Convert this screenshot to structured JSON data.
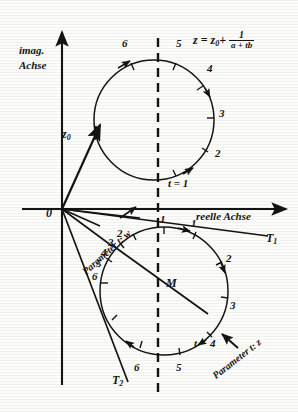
{
  "figure": {
    "kind": "complex-plane-diagram",
    "background": "#fdfdfc",
    "ink": "#141414"
  },
  "axes": {
    "imaginary_label_line1": "imag.",
    "imaginary_label_line2": "Achse",
    "real_label": "reelle Achse",
    "origin_label": "0"
  },
  "formula": {
    "lhs": "z",
    "equals": "=",
    "z0": "z",
    "z0_sub": "0",
    "plus": "+",
    "numerator": "1",
    "denominator": "a + tb"
  },
  "vectors": {
    "z0_label": "z",
    "z0_sub": "0"
  },
  "tangents": {
    "t1_label": "T",
    "t1_sub": "1",
    "t2_label": "T",
    "t2_sub": "2"
  },
  "center": {
    "label": "M"
  },
  "annotations": {
    "parameter_w": "Parameter t: w",
    "parameter_z": "Parameter t: z",
    "t_equals_one": "t = 1",
    "t_marker": "t"
  },
  "upper_circle": {
    "name": "w-circle",
    "cx": 154,
    "cy": 120,
    "r": 60,
    "ticks": [
      {
        "label": "6",
        "x": 122,
        "y": 45
      },
      {
        "label": "5",
        "x": 176,
        "y": 45
      },
      {
        "label": "4",
        "x": 206,
        "y": 70
      },
      {
        "label": "3",
        "x": 222,
        "y": 112
      },
      {
        "label": "2",
        "x": 218,
        "y": 152
      },
      {
        "label": "t = 1",
        "x": 170,
        "y": 180
      }
    ]
  },
  "lower_circle": {
    "name": "z-circle",
    "cx": 164,
    "cy": 291,
    "r": 64,
    "ticks": [
      {
        "label": "1",
        "x": 164,
        "y": 216
      },
      {
        "label": "1",
        "x": 194,
        "y": 222
      },
      {
        "label": "2",
        "x": 118,
        "y": 234
      },
      {
        "label": "3",
        "x": 110,
        "y": 243
      },
      {
        "label": "4",
        "x": 104,
        "y": 253
      },
      {
        "label": "5",
        "x": 99,
        "y": 264
      },
      {
        "label": "6",
        "x": 95,
        "y": 277
      },
      {
        "label": "2",
        "x": 226,
        "y": 258
      },
      {
        "label": "3",
        "x": 230,
        "y": 305
      },
      {
        "label": "4",
        "x": 212,
        "y": 345
      },
      {
        "label": "t",
        "x": 197,
        "y": 344
      },
      {
        "label": "5",
        "x": 178,
        "y": 370
      },
      {
        "label": "6",
        "x": 135,
        "y": 370
      }
    ]
  }
}
